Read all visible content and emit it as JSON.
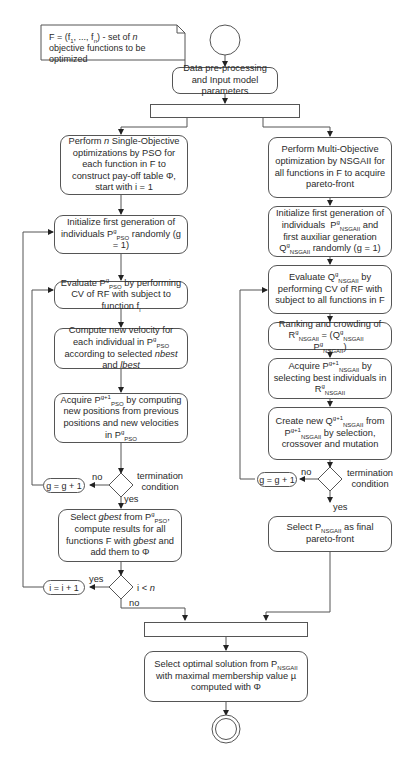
{
  "diagram": {
    "type": "activity-flowchart",
    "note": {
      "text_html": "F = (f<sub>1</sub>, ..., f<sub>n</sub>) - set of <i>n</i> objective functions to be optimized"
    },
    "start": {
      "shape": "circle"
    },
    "preprocess": {
      "text": "Data pre-processing and Input model parameters"
    },
    "fork": {
      "shape": "bar"
    },
    "left": {
      "title": "PSO branch",
      "steps": [
        {
          "id": "pso-init-loop",
          "html": "Perform <i>n</i> Single-Objective optimizations by PSO for each function in F to construct pay-off table Φ, start with i = 1"
        },
        {
          "id": "pso-init-gen",
          "html": "Initialize first generation of individuals P<sup>g</sup><sub>PSO</sub> randomly (g = 1)"
        },
        {
          "id": "pso-evaluate",
          "html": "Evaluate P<sup>g</sup><sub>PSO</sub> by performing CV of RF with subject to function f<sub>i</sub>"
        },
        {
          "id": "pso-velocity",
          "html": "Compute new velocity for each individual in P<sup>g</sup><sub>PSO</sub> according to selected <i>nbest</i> and <i>lbest</i>"
        },
        {
          "id": "pso-acquire",
          "html": "Acquire P<sup>g+1</sup><sub>PSO</sub> by computing new positions from previous positions and new velocities in P<sup>g</sup><sub>PSO</sub>"
        },
        {
          "id": "pso-gbest",
          "html": "Select <i>gbest</i> from P<sup>g</sup><sub>PSO</sub>, compute results for all functions F with <i>gbest</i> and add them to Φ"
        }
      ],
      "termination_label": "termination condition",
      "increment_g": "g = g + 1",
      "no_label": "no",
      "yes_label": "yes",
      "loop_condition_html": "i &lt; <i>n</i>",
      "increment_i": "i = i + 1",
      "loop_yes": "yes",
      "loop_no": "no"
    },
    "right": {
      "title": "NSGAII branch",
      "steps": [
        {
          "id": "nsga-perform",
          "html": "Perform Multi-Objective optimization by NSGAII for all functions in F to acquire pareto-front"
        },
        {
          "id": "nsga-init",
          "html": "Initialize first generation of individuals &nbsp;P<sup>g</sup><sub>NSGAII</sub> and first auxiliar generation Q<sup>g</sup><sub>NSGAII</sub> randomly (g = 1)"
        },
        {
          "id": "nsga-evaluate",
          "html": "Evaluate Q<sup>g</sup><sub>NSGAII</sub> by performing CV of RF with subject to all functions in F"
        },
        {
          "id": "nsga-ranking",
          "html": "Ranking and crowding of R<sup>g</sup><sub>NSGAII</sub> = (Q<sup>g</sup><sub>NSGAII</sub> &nbsp;&nbsp; P<sup>g</sup><sub>NSGAII</sub>)"
        },
        {
          "id": "nsga-acquire",
          "html": "Acquire P<sup>g+1</sup><sub>NSGAII</sub> by selecting best individuals in R<sup>g</sup><sub>NSGAII</sub>"
        },
        {
          "id": "nsga-create",
          "html": "Create new Q<sup>g+1</sup><sub>NSGAII</sub> from P<sup>g+1</sup><sub>NSGAII</sub> by selection, crossover and mutation"
        },
        {
          "id": "nsga-final",
          "html": "Select P<sub>NSGAII</sub> as final pareto-front"
        }
      ],
      "termination_label": "termination condition",
      "increment_g": "g = g + 1",
      "no_label": "no",
      "yes_label": "yes"
    },
    "join": {
      "shape": "bar"
    },
    "final": {
      "html": "Select optimal solution from P<sub>NSGAII</sub> with maximal membership value µ computed with Φ"
    },
    "end": {
      "shape": "double-circle"
    }
  }
}
